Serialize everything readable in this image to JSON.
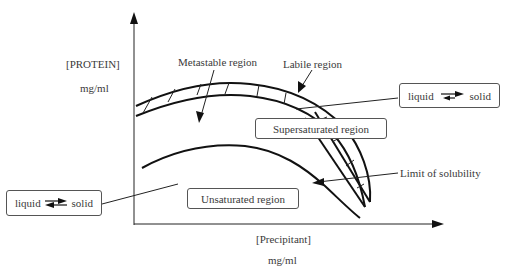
{
  "diagram": {
    "type": "protein crystallization phase diagram",
    "y_axis": {
      "label": "[PROTEIN]",
      "unit": "mg/ml"
    },
    "x_axis": {
      "label": "[Precipitant]",
      "unit": "mg/ml"
    },
    "regions": {
      "metastable": "Metastable region",
      "labile": "Labile region",
      "supersaturated": "Supersaturated region",
      "unsaturated": "Unsaturated region"
    },
    "curves": {
      "solubility": "Limit of solubility"
    },
    "equilibrium_upper": {
      "left": "liquid",
      "right": "solid",
      "direction": "forward"
    },
    "equilibrium_lower": {
      "left": "liquid",
      "right": "solid",
      "direction": "reversible"
    },
    "colors": {
      "line": "#1a1a1a",
      "text": "#3a3a3a",
      "background": "#ffffff"
    }
  }
}
